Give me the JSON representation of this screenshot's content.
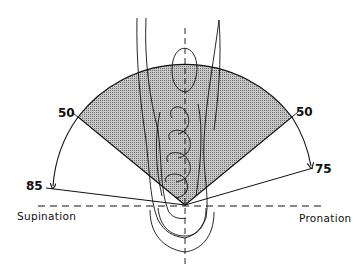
{
  "figure": {
    "labels": {
      "supination": "Supination",
      "pronation": "Pronation",
      "left_functional": "50",
      "right_functional": "50",
      "left_max": "85",
      "right_max": "75"
    },
    "angles_deg": {
      "supination_functional": 50,
      "pronation_functional": 50,
      "supination_max": 85,
      "pronation_max": 75
    },
    "colors": {
      "line": "#111111",
      "sector_fill": "#9a9a9a",
      "background": "#ffffff"
    }
  }
}
